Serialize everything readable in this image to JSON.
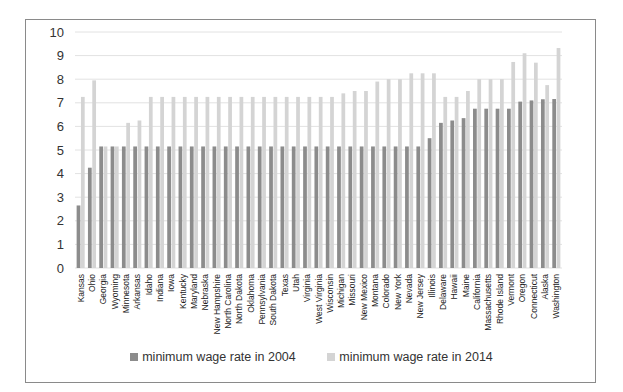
{
  "chart_data": {
    "type": "bar",
    "title": "",
    "xlabel": "",
    "ylabel": "",
    "ylim": [
      0,
      10
    ],
    "yticks": [
      0,
      1,
      2,
      3,
      4,
      5,
      6,
      7,
      8,
      9,
      10
    ],
    "grid": true,
    "legend_position": "bottom",
    "categories": [
      "Kansas",
      "Ohio",
      "Georgia",
      "Wyoming",
      "Minnesota",
      "Arkansas",
      "Idaho",
      "Indiana",
      "Iowa",
      "Kentucky",
      "Maryland",
      "Nebraska",
      "New Hampshire",
      "North Carolina",
      "North Dakota",
      "Oklahoma",
      "Pennsylvania",
      "South Dakota",
      "Texas",
      "Utah",
      "Virginia",
      "West Virginia",
      "Wisconsin",
      "Michigan",
      "Missouri",
      "New Mexico",
      "Montana",
      "Colorado",
      "New York",
      "Nevada",
      "New Jersey",
      "Illinois",
      "Delaware",
      "Hawaii",
      "Maine",
      "California",
      "Massachusetts",
      "Rhode Island",
      "Vermont",
      "Oregon",
      "Connecticut",
      "Alaska",
      "Washington"
    ],
    "series": [
      {
        "name": "minimum wage rate in 2004",
        "color": "#8c8c8c",
        "values": [
          2.65,
          4.25,
          5.15,
          5.15,
          5.15,
          5.15,
          5.15,
          5.15,
          5.15,
          5.15,
          5.15,
          5.15,
          5.15,
          5.15,
          5.15,
          5.15,
          5.15,
          5.15,
          5.15,
          5.15,
          5.15,
          5.15,
          5.15,
          5.15,
          5.15,
          5.15,
          5.15,
          5.15,
          5.15,
          5.15,
          5.15,
          5.5,
          6.15,
          6.25,
          6.35,
          6.75,
          6.75,
          6.75,
          6.75,
          7.05,
          7.1,
          7.15,
          7.16
        ]
      },
      {
        "name": "minimum wage rate in 2014",
        "color": "#d4d4d4",
        "values": [
          7.25,
          7.95,
          5.15,
          5.15,
          6.15,
          6.25,
          7.25,
          7.25,
          7.25,
          7.25,
          7.25,
          7.25,
          7.25,
          7.25,
          7.25,
          7.25,
          7.25,
          7.25,
          7.25,
          7.25,
          7.25,
          7.25,
          7.25,
          7.4,
          7.5,
          7.5,
          7.9,
          8.0,
          8.0,
          8.25,
          8.25,
          8.25,
          7.25,
          7.25,
          7.5,
          8.0,
          8.0,
          8.0,
          8.73,
          9.1,
          8.7,
          7.75,
          9.32
        ]
      }
    ]
  },
  "legend": {
    "items": [
      {
        "label": "minimum wage rate in 2004",
        "color": "#8c8c8c"
      },
      {
        "label": "minimum wage rate in 2014",
        "color": "#d4d4d4"
      }
    ]
  }
}
